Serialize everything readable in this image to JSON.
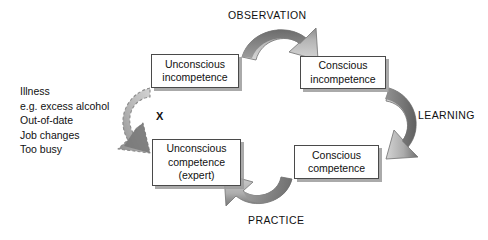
{
  "diagram": {
    "stages": [
      {
        "id": "unconscious-incompetence",
        "lines": [
          "Unconscious",
          "incompetence"
        ],
        "x": 151,
        "y": 54,
        "w": 88,
        "h": 34
      },
      {
        "id": "conscious-incompetence",
        "lines": [
          "Conscious",
          "incompetence"
        ],
        "x": 300,
        "y": 56,
        "w": 86,
        "h": 33
      },
      {
        "id": "conscious-competence",
        "lines": [
          "Conscious",
          "competence"
        ],
        "x": 294,
        "y": 145,
        "w": 85,
        "h": 34
      },
      {
        "id": "unconscious-competence",
        "lines": [
          "Unconscious",
          "competence",
          "(expert)"
        ],
        "x": 152,
        "y": 139,
        "w": 89,
        "h": 47
      }
    ],
    "cycle_labels": [
      {
        "id": "observation",
        "text": "OBSERVATION",
        "x": 228,
        "y": 9
      },
      {
        "id": "learning",
        "text": "LEARNING",
        "x": 418,
        "y": 109
      },
      {
        "id": "practice",
        "text": "PRACTICE",
        "x": 248,
        "y": 214
      }
    ],
    "regression_causes": [
      "Illness",
      "e.g. excess alcohol",
      "Out-of-date",
      "Job changes",
      "Too busy"
    ],
    "block_marker": "X",
    "colors": {
      "arrow_light": "#c9c9c9",
      "arrow_mid": "#a8a8a8",
      "arrow_dark": "#6f6f6f",
      "arrow_outline": "#7a7a7a",
      "box_border": "#4a4a4a",
      "box_shadow": "#9b9b9b",
      "text": "#111111",
      "background": "#ffffff"
    }
  }
}
